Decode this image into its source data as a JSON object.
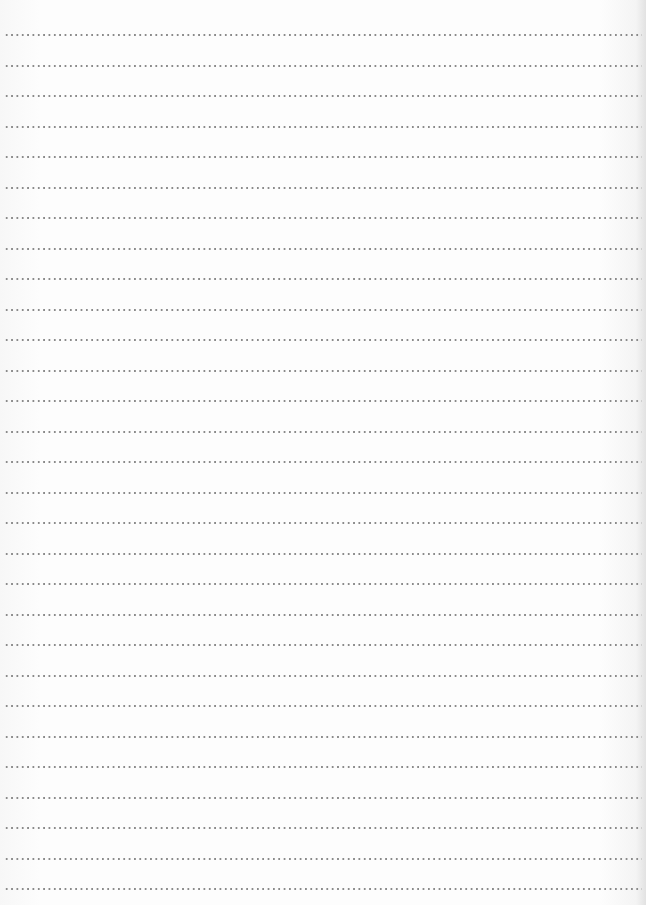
{
  "paper": {
    "type": "dotted-lined-paper",
    "line_count": 29,
    "first_line_y": 34,
    "line_spacing_px": 30.5,
    "dot_spacing_px": 5.35,
    "dot_color": "#8a8a8a",
    "paper_color": "#fdfdfd"
  }
}
